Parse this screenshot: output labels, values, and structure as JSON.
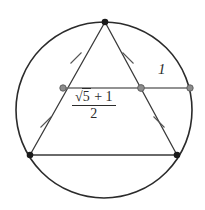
{
  "figure": {
    "colors": {
      "circle_stroke": "#2b2b2b",
      "triangle_stroke": "#3a3a3a",
      "chord_stroke": "#6e6e6e",
      "vertex_fill": "#1a1a1a",
      "chord_point_fill": "#8c8c8c",
      "chord_point_stroke": "#5a5a5a",
      "tick_stroke": "#555555",
      "text": "#2b2b2b",
      "background": "#ffffff"
    },
    "circle": {
      "name": "circumscribed-circle",
      "cx": 104,
      "cy": 110,
      "r": 88,
      "stroke_width": 1.6
    },
    "triangle": {
      "name": "inscribed-triangle",
      "stroke_width": 1.3,
      "vertices": [
        {
          "name": "apex-vertex",
          "x": 105,
          "y": 22
        },
        {
          "name": "bottom-left-vertex",
          "x": 30,
          "y": 155
        },
        {
          "name": "bottom-right-vertex",
          "x": 177,
          "y": 155
        }
      ]
    },
    "chord": {
      "name": "horizontal-chord",
      "stroke_width": 1.4,
      "x1": 63,
      "x2": 190,
      "y": 88,
      "points": [
        {
          "name": "chord-left-point",
          "x": 63,
          "y": 88,
          "r": 3.2
        },
        {
          "name": "chord-mid-point",
          "x": 141,
          "y": 88,
          "r": 3.4
        },
        {
          "name": "chord-right-point",
          "x": 190,
          "y": 88,
          "r": 3.2
        }
      ]
    },
    "vertex_markers": [
      {
        "name": "apex-vertex-marker",
        "x": 105,
        "y": 22,
        "r": 3.2
      },
      {
        "name": "bottom-left-vertex-marker",
        "x": 30,
        "y": 155,
        "r": 3.2
      },
      {
        "name": "bottom-right-vertex-marker",
        "x": 177,
        "y": 155,
        "r": 3.2
      }
    ],
    "tick_marks": [
      {
        "name": "tick-upper-left-side",
        "x": 76,
        "y": 58,
        "angle": -60
      },
      {
        "name": "tick-upper-right-side",
        "x": 128,
        "y": 58,
        "angle": 60
      },
      {
        "name": "tick-lower-left-side",
        "x": 46,
        "y": 122,
        "angle": -60
      },
      {
        "name": "tick-lower-right-side",
        "x": 159,
        "y": 122,
        "angle": 60
      },
      {
        "name": "tick-length",
        "length": 11,
        "stroke_width": 1.1
      }
    ],
    "labels": {
      "unit_label": "1",
      "golden_ratio": {
        "numerator_root_symbol": "√",
        "numerator_radicand": "5",
        "numerator_plus": "+",
        "numerator_addend": "1",
        "denominator": "2",
        "full_text": "(√5 + 1) / 2"
      }
    }
  }
}
